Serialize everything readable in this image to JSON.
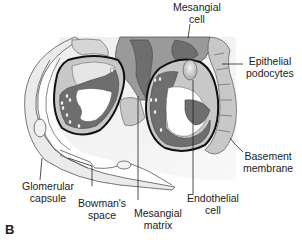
{
  "figure": {
    "panel_label": "B",
    "labels": {
      "mesangial_cell": [
        "Mesangial",
        "cell"
      ],
      "epithelial_podocytes": [
        "Epithelial",
        "podocytes"
      ],
      "basement_membrane": [
        "Basement",
        "membrane"
      ],
      "endothelial_cell": [
        "Endothelial",
        "cell"
      ],
      "mesangial_matrix": [
        "Mesangial",
        "matrix"
      ],
      "bowmans_space": [
        "Bowman's",
        "space"
      ],
      "glomerular_capsule": [
        "Glomerular",
        "capsule"
      ]
    },
    "colors": {
      "dark_gray": "#6e6e6e",
      "mid_gray": "#9a9a9a",
      "light_gray": "#c8c8c8",
      "pale_gray": "#e6e6e6",
      "outline": "#111111"
    }
  }
}
